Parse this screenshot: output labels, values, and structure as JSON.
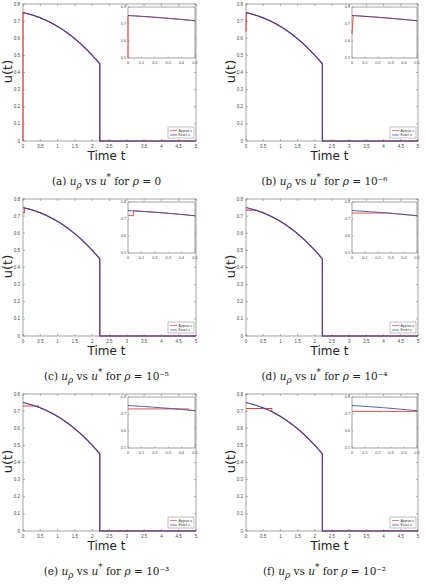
{
  "colors": {
    "approx": "#e8423a",
    "exact": "#3a3f9e",
    "axis": "#666666",
    "tick_text": "#444444"
  },
  "legend": {
    "approx": "Approx u",
    "exact": "Exact u"
  },
  "axis_labels": {
    "x": "Time t",
    "y": "u(t)"
  },
  "panels": [
    {
      "label": "(a)",
      "caption_prefix": "(a)",
      "caption_rho": "0"
    },
    {
      "label": "(b)",
      "caption_prefix": "(b)",
      "caption_rho": "10⁻⁶"
    },
    {
      "label": "(c)",
      "caption_prefix": "(c)",
      "caption_rho": "10⁻⁵"
    },
    {
      "label": "(d)",
      "caption_prefix": "(d)",
      "caption_rho": "10⁻⁴"
    },
    {
      "label": "(e)",
      "caption_prefix": "(e)",
      "caption_rho": "10⁻³"
    },
    {
      "label": "(f)",
      "caption_prefix": "(f)",
      "caption_rho": "10⁻²"
    }
  ],
  "chart_data": [
    {
      "type": "line",
      "title": "(a) u_rho vs u* for rho = 0",
      "xlabel": "Time t",
      "ylabel": "u(t)",
      "xlim": [
        0,
        5
      ],
      "ylim": [
        0,
        0.8
      ],
      "xticks": [
        "0",
        "0.5",
        "1",
        "1.5",
        "2",
        "2.5",
        "3",
        "3.5",
        "4",
        "4.5",
        "5"
      ],
      "yticks": [
        "0",
        "0.1",
        "0.2",
        "0.3",
        "0.4",
        "0.5",
        "0.6",
        "0.7",
        "0.8"
      ],
      "legend": [
        "Approx u",
        "Exact u"
      ],
      "legend_position": "lower right",
      "exact_curve": {
        "u0": 0.75,
        "t_switch": 2.22,
        "u_at_switch": 0.45
      },
      "approx_deviation": {
        "type": "spike",
        "t_end": 0.0,
        "u_start": 0.0
      },
      "inset": {
        "xlim": [
          0,
          0.5
        ],
        "ylim": [
          0.5,
          0.8
        ],
        "xticks": [
          "0",
          "0.1",
          "0.2",
          "0.3",
          "0.4",
          "0.5"
        ],
        "yticks": [
          "0.5",
          "0.6",
          "0.7",
          "0.8"
        ]
      }
    },
    {
      "type": "line",
      "title": "(b) u_rho vs u* for rho = 10^-6",
      "xlabel": "Time t",
      "ylabel": "u(t)",
      "xlim": [
        0,
        5
      ],
      "ylim": [
        0,
        0.8
      ],
      "xticks": [
        "0",
        "0.5",
        "1",
        "1.5",
        "2",
        "2.5",
        "3",
        "3.5",
        "4",
        "4.5",
        "5"
      ],
      "yticks": [
        "0",
        "0.1",
        "0.2",
        "0.3",
        "0.4",
        "0.5",
        "0.6",
        "0.7",
        "0.8"
      ],
      "legend": [
        "Approx u",
        "Exact u"
      ],
      "legend_position": "lower right",
      "exact_curve": {
        "u0": 0.75,
        "t_switch": 2.22,
        "u_at_switch": 0.45
      },
      "approx_deviation": {
        "type": "spike",
        "t_end": 0.01,
        "u_start": 0.64
      },
      "inset": {
        "xlim": [
          0,
          0.5
        ],
        "ylim": [
          0.5,
          0.8
        ],
        "xticks": [
          "0",
          "0.1",
          "0.2",
          "0.3",
          "0.4",
          "0.5"
        ],
        "yticks": [
          "0.5",
          "0.6",
          "0.7",
          "0.8"
        ]
      }
    },
    {
      "type": "line",
      "title": "(c) u_rho vs u* for rho = 10^-5",
      "xlabel": "Time t",
      "ylabel": "u(t)",
      "xlim": [
        0,
        5
      ],
      "ylim": [
        0,
        0.8
      ],
      "xticks": [
        "0",
        "0.5",
        "1",
        "1.5",
        "2",
        "2.5",
        "3",
        "3.5",
        "4",
        "4.5",
        "5"
      ],
      "yticks": [
        "0",
        "0.1",
        "0.2",
        "0.3",
        "0.4",
        "0.5",
        "0.6",
        "0.7",
        "0.8"
      ],
      "legend": [
        "Approx u",
        "Exact u"
      ],
      "legend_position": "lower right",
      "exact_curve": {
        "u0": 0.75,
        "t_switch": 2.22,
        "u_at_switch": 0.45
      },
      "approx_deviation": {
        "type": "plateau",
        "t_end": 0.04,
        "u_plateau": 0.72
      },
      "inset": {
        "xlim": [
          0,
          0.5
        ],
        "ylim": [
          0.5,
          0.8
        ],
        "xticks": [
          "0",
          "0.1",
          "0.2",
          "0.3",
          "0.4",
          "0.5"
        ],
        "yticks": [
          "0.5",
          "0.6",
          "0.7",
          "0.8"
        ]
      }
    },
    {
      "type": "line",
      "title": "(d) u_rho vs u* for rho = 10^-4",
      "xlabel": "Time t",
      "ylabel": "u(t)",
      "xlim": [
        0,
        5
      ],
      "ylim": [
        0,
        0.8
      ],
      "xticks": [
        "0",
        "0.5",
        "1",
        "1.5",
        "2",
        "2.5",
        "3",
        "3.5",
        "4",
        "4.5",
        "5"
      ],
      "yticks": [
        "0",
        "0.1",
        "0.2",
        "0.3",
        "0.4",
        "0.5",
        "0.6",
        "0.7",
        "0.8"
      ],
      "legend": [
        "Approx u",
        "Exact u"
      ],
      "legend_position": "lower right",
      "exact_curve": {
        "u0": 0.75,
        "t_switch": 2.22,
        "u_at_switch": 0.45
      },
      "approx_deviation": {
        "type": "plateau",
        "t_end": 0.25,
        "u_plateau": 0.735
      },
      "inset": {
        "xlim": [
          0,
          0.5
        ],
        "ylim": [
          0.5,
          0.8
        ],
        "xticks": [
          "0",
          "0.1",
          "0.2",
          "0.3",
          "0.4",
          "0.5"
        ],
        "yticks": [
          "0.5",
          "0.6",
          "0.7",
          "0.8"
        ]
      }
    },
    {
      "type": "line",
      "title": "(e) u_rho vs u* for rho = 10^-3",
      "xlabel": "Time t",
      "ylabel": "u(t)",
      "xlim": [
        0,
        5
      ],
      "ylim": [
        0,
        0.8
      ],
      "xticks": [
        "0",
        "0.5",
        "1",
        "1.5",
        "2",
        "2.5",
        "3",
        "3.5",
        "4",
        "4.5",
        "5"
      ],
      "yticks": [
        "0",
        "0.1",
        "0.2",
        "0.3",
        "0.4",
        "0.5",
        "0.6",
        "0.7",
        "0.8"
      ],
      "legend": [
        "Approx u",
        "Exact u"
      ],
      "legend_position": "lower right",
      "exact_curve": {
        "u0": 0.75,
        "t_switch": 2.22,
        "u_at_switch": 0.45
      },
      "approx_deviation": {
        "type": "plateau",
        "t_end": 0.45,
        "u_plateau": 0.73
      },
      "inset": {
        "xlim": [
          0,
          0.5
        ],
        "ylim": [
          0.5,
          0.8
        ],
        "xticks": [
          "0",
          "0.1",
          "0.2",
          "0.3",
          "0.4",
          "0.5"
        ],
        "yticks": [
          "0.5",
          "0.6",
          "0.7",
          "0.8"
        ]
      }
    },
    {
      "type": "line",
      "title": "(f) u_rho vs u* for rho = 10^-2",
      "xlabel": "Time t",
      "ylabel": "u(t)",
      "xlim": [
        0,
        5
      ],
      "ylim": [
        0,
        0.8
      ],
      "xticks": [
        "0",
        "0.5",
        "1",
        "1.5",
        "2",
        "2.5",
        "3",
        "3.5",
        "4",
        "4.5",
        "5"
      ],
      "yticks": [
        "0",
        "0.1",
        "0.2",
        "0.3",
        "0.4",
        "0.5",
        "0.6",
        "0.7",
        "0.8"
      ],
      "legend": [
        "Approx u",
        "Exact u"
      ],
      "legend_position": "lower right",
      "exact_curve": {
        "u0": 0.75,
        "t_switch": 2.22,
        "u_at_switch": 0.45
      },
      "approx_deviation": {
        "type": "plateau",
        "t_end": 0.75,
        "u_plateau": 0.715
      },
      "inset": {
        "xlim": [
          0,
          0.5
        ],
        "ylim": [
          0.5,
          0.8
        ],
        "xticks": [
          "0",
          "0.1",
          "0.2",
          "0.3",
          "0.4",
          "0.5"
        ],
        "yticks": [
          "0.5",
          "0.6",
          "0.7",
          "0.8"
        ]
      }
    }
  ]
}
